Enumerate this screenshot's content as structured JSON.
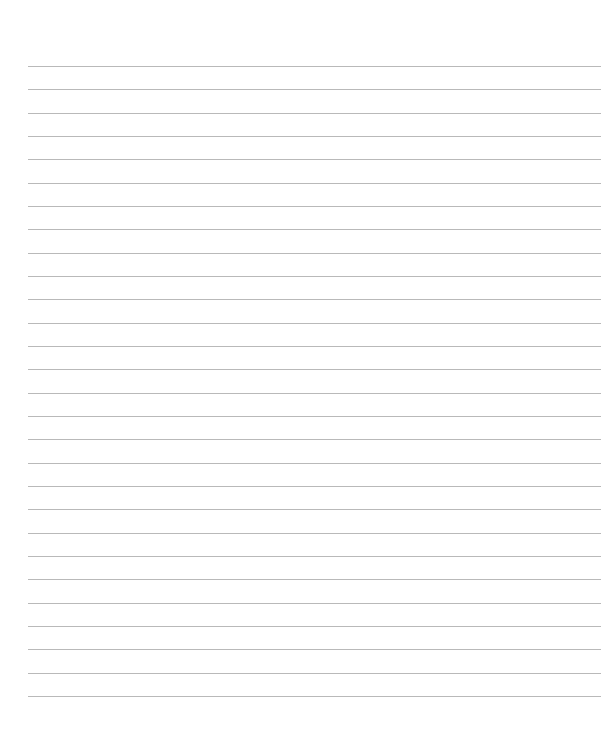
{
  "page": {
    "type": "blank lined paper",
    "background_color": "#ffffff",
    "line_color": "#b9b9b9",
    "line_count": 28,
    "first_line_y": 66,
    "line_spacing": 23.33,
    "line_left_x": 28,
    "line_right_x": 601,
    "text": ""
  }
}
